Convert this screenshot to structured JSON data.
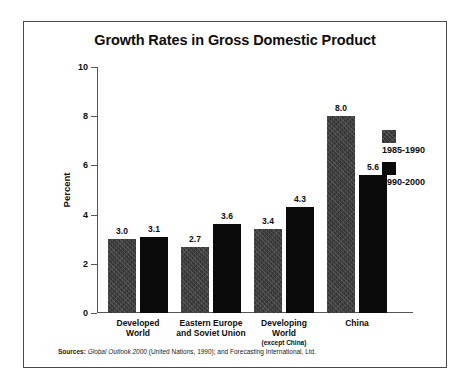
{
  "figure": {
    "title": "Growth Rates in Gross Domestic Product",
    "source": {
      "label": "Sources:",
      "title": "Global Outlook 2000",
      "rest": "(United Nations, 1990); and Forecasting International, Ltd."
    }
  },
  "chart_data": {
    "type": "bar",
    "title": "Growth Rates in Gross Domestic Product",
    "xlabel": "",
    "ylabel": "Percent",
    "ylim": [
      0,
      10
    ],
    "yticks": [
      0,
      2,
      4,
      6,
      8,
      10
    ],
    "ytick_labels": [
      "0",
      "2",
      "4",
      "6",
      "8",
      "10"
    ],
    "grid": false,
    "legend_position": "right",
    "categories": [
      "Developed World",
      "Eastern Europe and Soviet Union",
      "Developing World",
      "China"
    ],
    "category_lines": [
      [
        "Developed",
        "World"
      ],
      [
        "Eastern Europe",
        "and Soviet Union"
      ],
      [
        "Developing",
        "World"
      ],
      [
        "China"
      ]
    ],
    "category_sublabels": [
      "",
      "",
      "(except China)",
      ""
    ],
    "series": [
      {
        "name": "1985-1990",
        "color": "#343434",
        "values": [
          3.0,
          2.7,
          3.4,
          8.0
        ],
        "labels": [
          "3.0",
          "2.7",
          "3.4",
          "8.0"
        ]
      },
      {
        "name": "1990-2000",
        "color": "#0a0a0a",
        "values": [
          3.1,
          3.6,
          4.3,
          5.6
        ],
        "labels": [
          "3.1",
          "3.6",
          "4.3",
          "5.6"
        ]
      }
    ]
  }
}
